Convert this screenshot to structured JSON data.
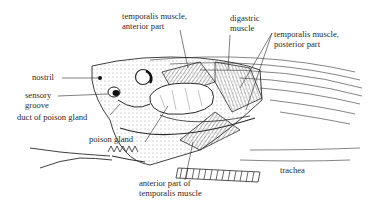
{
  "diagram": {
    "labels": {
      "temporalis_anterior": [
        "temporalis muscle,",
        "anterior part"
      ],
      "digastric": [
        "digastric",
        "muscle"
      ],
      "temporalis_posterior": [
        "temporalis muscle,",
        "posterior part"
      ],
      "nostril": "nostril",
      "sensory_groove": [
        "sensory",
        "groove"
      ],
      "duct": "duct of poison gland",
      "poison_gland": "poison gland",
      "trachea": "trachea",
      "anterior_temporalis": [
        "anterior part of",
        "temporalis muscle"
      ]
    },
    "colors": {
      "ink": "#2a2a2a",
      "background": "#ffffff"
    }
  }
}
